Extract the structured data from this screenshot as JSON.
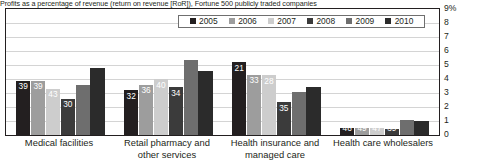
{
  "title": "Profits as a percentage of revenue (return on revenue [RoR]), Fortune 500 publicly traded companies",
  "axis": {
    "ylabel": "",
    "ticks": [
      "9%",
      "8",
      "7",
      "6",
      "5",
      "4",
      "3",
      "2",
      "1",
      "0"
    ],
    "ymin": 0,
    "ymax": 9
  },
  "legend": {
    "position": "top-center",
    "items": [
      {
        "label": "2005",
        "color": "#231f20"
      },
      {
        "label": "2006",
        "color": "#9d9d9d"
      },
      {
        "label": "2007",
        "color": "#cdcdcd"
      },
      {
        "label": "2008",
        "color": "#3b3b3b"
      },
      {
        "label": "2009",
        "color": "#6e6e6e"
      },
      {
        "label": "2010",
        "color": "#2b2b2b"
      }
    ]
  },
  "chart_data": {
    "type": "bar",
    "title": "Profits as a percentage of revenue (return on revenue [RoR]), Fortune 500 publicly traded companies",
    "xlabel": "",
    "ylabel": "",
    "ylim": [
      0,
      9
    ],
    "grid": true,
    "legend_position": "top-center",
    "categories": [
      "Medical facilities",
      "Retail pharmacy and other services",
      "Health insurance and managed care",
      "Health care wholesalers"
    ],
    "series": [
      {
        "name": "2005",
        "color": "#231f20",
        "values": [
          3.9,
          3.2,
          5.21,
          0.46
        ],
        "labels": [
          "39",
          "32",
          "21",
          "46"
        ]
      },
      {
        "name": "2006",
        "color": "#9d9d9d",
        "values": [
          3.9,
          3.6,
          4.33,
          0.49
        ],
        "labels": [
          "39",
          "36",
          "33",
          "49"
        ]
      },
      {
        "name": "2007",
        "color": "#cdcdcd",
        "values": [
          3.3,
          4.0,
          4.28,
          0.47
        ],
        "labels": [
          "43",
          "40",
          "28",
          "47"
        ]
      },
      {
        "name": "2008",
        "color": "#3b3b3b",
        "values": [
          2.6,
          3.4,
          2.35,
          0.39
        ],
        "labels": [
          "30",
          "34",
          "35",
          "39"
        ]
      },
      {
        "name": "2009",
        "color": "#6e6e6e",
        "values": [
          3.6,
          5.4,
          3.1,
          1.1
        ],
        "labels": [
          "",
          "",
          "",
          ""
        ]
      },
      {
        "name": "2010",
        "color": "#2b2b2b",
        "values": [
          4.8,
          4.6,
          3.4,
          1.0
        ],
        "labels": [
          "",
          "",
          "",
          ""
        ]
      }
    ]
  }
}
